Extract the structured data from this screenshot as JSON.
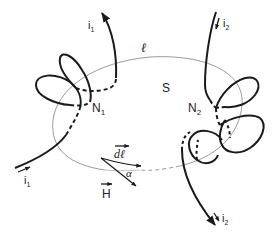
{
  "diagram": {
    "type": "physics-ampere-loop",
    "colors": {
      "wire": "#1a1a1a",
      "loop": "#9a9a9a",
      "text": "#222222",
      "background": "#ffffff"
    },
    "labels": {
      "loop": "ℓ",
      "surface": "S",
      "turns_1": "N",
      "turns_1_sub": "1",
      "turns_2": "N",
      "turns_2_sub": "2",
      "current_1_top": "i",
      "current_1_top_sub": "1",
      "current_1_bottom": "i",
      "current_1_bottom_sub": "1",
      "current_2_top": "i",
      "current_2_top_sub": "2",
      "current_2_bottom": "i",
      "current_2_bottom_sub": "2",
      "dl": "dℓ",
      "H": "H",
      "alpha": "α"
    }
  }
}
